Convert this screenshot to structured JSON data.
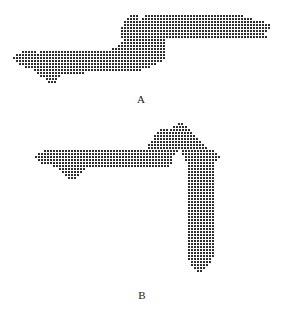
{
  "figure": {
    "panels": [
      {
        "id": "A",
        "label": "A",
        "label_pos": [
          141,
          93
        ],
        "spacing": 3,
        "dot_color": "#2a2a2a",
        "rows": [
          [
            15,
            [
              [
                130,
                136
              ]
            ]
          ],
          [
            15,
            [
              [
                145,
                241
              ]
            ]
          ],
          [
            18,
            [
              [
                127,
                136
              ],
              [
                142,
                250
              ]
            ]
          ],
          [
            21,
            [
              [
                124,
                262
              ]
            ]
          ],
          [
            24,
            [
              [
                124,
                268
              ]
            ]
          ],
          [
            27,
            [
              [
                121,
                268
              ]
            ]
          ],
          [
            30,
            [
              [
                121,
                265
              ]
            ]
          ],
          [
            33,
            [
              [
                121,
                262
              ]
            ]
          ],
          [
            36,
            [
              [
                121,
                265
              ]
            ]
          ],
          [
            39,
            [
              [
                124,
                163
              ]
            ]
          ],
          [
            42,
            [
              [
                121,
                163
              ]
            ]
          ],
          [
            45,
            [
              [
                118,
                163
              ]
            ]
          ],
          [
            48,
            [
              [
                112,
                163
              ]
            ]
          ],
          [
            51,
            [
              [
                22,
                34
              ],
              [
                40,
                163
              ]
            ]
          ],
          [
            54,
            [
              [
                16,
                163
              ]
            ]
          ],
          [
            57,
            [
              [
                13,
                163
              ]
            ]
          ],
          [
            60,
            [
              [
                16,
                160
              ]
            ]
          ],
          [
            63,
            [
              [
                19,
                154
              ]
            ]
          ],
          [
            66,
            [
              [
                25,
                148
              ]
            ]
          ],
          [
            69,
            [
              [
                34,
                139
              ]
            ]
          ],
          [
            72,
            [
              [
                37,
                82
              ]
            ]
          ],
          [
            75,
            [
              [
                40,
                58
              ]
            ]
          ],
          [
            78,
            [
              [
                46,
                55
              ]
            ]
          ],
          [
            81,
            [
              [
                48,
                54
              ]
            ]
          ]
        ]
      },
      {
        "id": "B",
        "label": "B",
        "label_pos": [
          142,
          289
        ],
        "spacing": 3,
        "dot_color": "#2a2a2a",
        "rows": [
          [
            123,
            [
              [
                178,
                181
              ]
            ]
          ],
          [
            126,
            [
              [
                173,
                185
              ]
            ]
          ],
          [
            129,
            [
              [
                160,
                166
              ],
              [
                170,
                188
              ]
            ]
          ],
          [
            132,
            [
              [
                157,
                191
              ]
            ]
          ],
          [
            135,
            [
              [
                154,
                194
              ]
            ]
          ],
          [
            138,
            [
              [
                154,
                197
              ]
            ]
          ],
          [
            141,
            [
              [
                151,
                200
              ]
            ]
          ],
          [
            144,
            [
              [
                148,
                203
              ]
            ]
          ],
          [
            147,
            [
              [
                148,
                206
              ]
            ]
          ],
          [
            150,
            [
              [
                44,
                176
              ],
              [
                182,
                212
              ]
            ]
          ],
          [
            153,
            [
              [
                38,
                173
              ],
              [
                182,
                215
              ]
            ]
          ],
          [
            156,
            [
              [
                35,
                170
              ],
              [
                185,
                218
              ]
            ]
          ],
          [
            159,
            [
              [
                38,
                170
              ],
              [
                185,
                215
              ]
            ]
          ],
          [
            162,
            [
              [
                41,
                170
              ],
              [
                188,
                212
              ]
            ]
          ],
          [
            165,
            [
              [
                53,
                167
              ],
              [
                188,
                212
              ]
            ]
          ],
          [
            168,
            [
              [
                59,
                85
              ],
              [
                188,
                212
              ]
            ]
          ],
          [
            171,
            [
              [
                62,
                82
              ],
              [
                188,
                212
              ]
            ]
          ],
          [
            174,
            [
              [
                65,
                79
              ],
              [
                188,
                212
              ]
            ]
          ],
          [
            177,
            [
              [
                68,
                74
              ],
              [
                188,
                212
              ]
            ]
          ],
          [
            180,
            [
              [
                188,
                212
              ]
            ]
          ],
          [
            183,
            [
              [
                188,
                212
              ]
            ]
          ],
          [
            186,
            [
              [
                188,
                212
              ]
            ]
          ],
          [
            189,
            [
              [
                188,
                212
              ]
            ]
          ],
          [
            192,
            [
              [
                188,
                212
              ]
            ]
          ],
          [
            195,
            [
              [
                188,
                212
              ]
            ]
          ],
          [
            198,
            [
              [
                188,
                212
              ]
            ]
          ],
          [
            201,
            [
              [
                188,
                212
              ]
            ]
          ],
          [
            204,
            [
              [
                188,
                212
              ]
            ]
          ],
          [
            207,
            [
              [
                188,
                212
              ]
            ]
          ],
          [
            210,
            [
              [
                188,
                212
              ]
            ]
          ],
          [
            213,
            [
              [
                188,
                212
              ]
            ]
          ],
          [
            216,
            [
              [
                188,
                212
              ]
            ]
          ],
          [
            219,
            [
              [
                188,
                212
              ]
            ]
          ],
          [
            222,
            [
              [
                188,
                212
              ]
            ]
          ],
          [
            225,
            [
              [
                188,
                212
              ]
            ]
          ],
          [
            228,
            [
              [
                188,
                212
              ]
            ]
          ],
          [
            231,
            [
              [
                188,
                212
              ]
            ]
          ],
          [
            234,
            [
              [
                188,
                212
              ]
            ]
          ],
          [
            237,
            [
              [
                188,
                212
              ]
            ]
          ],
          [
            240,
            [
              [
                188,
                212
              ]
            ]
          ],
          [
            243,
            [
              [
                188,
                212
              ]
            ]
          ],
          [
            246,
            [
              [
                188,
                212
              ]
            ]
          ],
          [
            249,
            [
              [
                188,
                212
              ]
            ]
          ],
          [
            252,
            [
              [
                188,
                212
              ]
            ]
          ],
          [
            255,
            [
              [
                188,
                212
              ]
            ]
          ],
          [
            258,
            [
              [
                188,
                209
              ]
            ]
          ],
          [
            261,
            [
              [
                191,
                209
              ]
            ]
          ],
          [
            264,
            [
              [
                191,
                206
              ]
            ]
          ],
          [
            267,
            [
              [
                194,
                203
              ]
            ]
          ],
          [
            270,
            [
              [
                197,
                200
              ]
            ]
          ]
        ]
      }
    ]
  }
}
